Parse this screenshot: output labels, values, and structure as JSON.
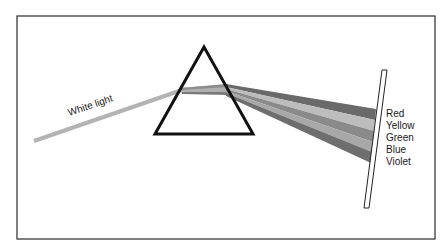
{
  "diagram": {
    "input_ray_label": "White light",
    "spectrum": [
      {
        "name": "Red",
        "shade": "#6a6a6a"
      },
      {
        "name": "Yellow",
        "shade": "#bdbdbd"
      },
      {
        "name": "Green",
        "shade": "#8a8a8a"
      },
      {
        "name": "Blue",
        "shade": "#a8a8a8"
      },
      {
        "name": "Violet",
        "shade": "#6e6e6e"
      }
    ],
    "colors": {
      "frame": "#2a2a2a",
      "prism_outline": "#111111",
      "white_ray": "#b3b3b3",
      "screen_outline": "#222222"
    }
  }
}
